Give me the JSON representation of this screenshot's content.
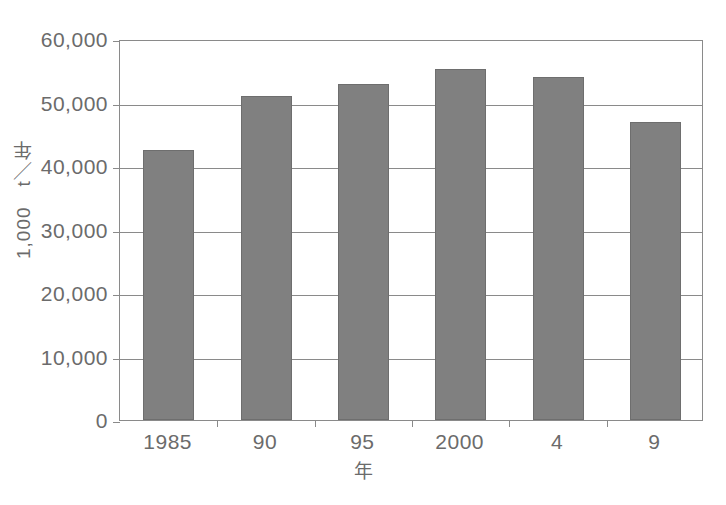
{
  "page": {
    "top_caption_faint": " "
  },
  "chart_data": {
    "type": "bar",
    "title": "",
    "subtitle": "",
    "xlabel": "年",
    "ylabel": "1,000　t／年",
    "categories": [
      "1985",
      "90",
      "95",
      "2000",
      "4",
      "9"
    ],
    "values": [
      42500,
      51000,
      52900,
      55200,
      54000,
      47000
    ],
    "ylim": [
      0,
      60000
    ],
    "ytick_values": [
      0,
      10000,
      20000,
      30000,
      40000,
      50000,
      60000
    ],
    "ytick_labels": [
      "0",
      "10,000",
      "20,000",
      "30,000",
      "40,000",
      "50,000",
      "60,000"
    ],
    "grid": "horizontal",
    "legend": "none",
    "bar_color": "#808080",
    "bar_edge_color": "#6e6e6e",
    "axis_color": "#8a8a8a",
    "text_color": "#6b6b6b",
    "background": "#ffffff"
  }
}
